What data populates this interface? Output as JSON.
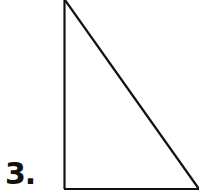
{
  "problem": {
    "number_label": "3.",
    "figure": {
      "shape": "right-triangle",
      "right_angle_corner": "bottom-left",
      "stroke_color": "#111111"
    }
  }
}
